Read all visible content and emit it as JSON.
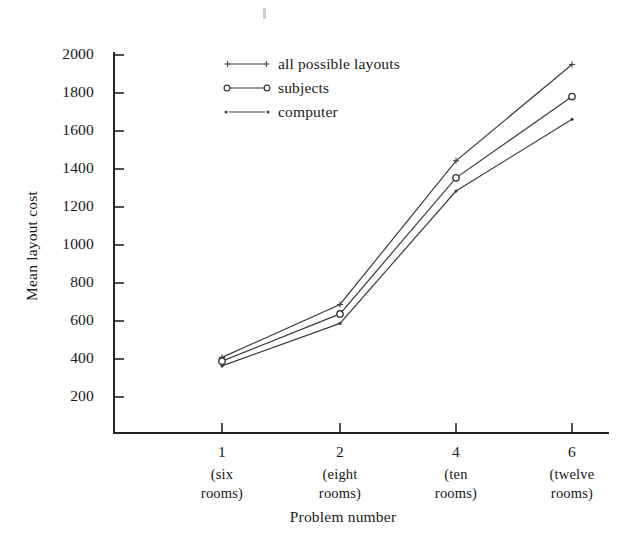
{
  "chart_data": {
    "type": "line",
    "title": "",
    "xlabel": "Problem number",
    "ylabel": "Mean layout cost",
    "categories": [
      "1",
      "2",
      "4",
      "6"
    ],
    "category_sublabels": [
      [
        "(six",
        "rooms)"
      ],
      [
        "(eight",
        "rooms)"
      ],
      [
        "(ten",
        "rooms)"
      ],
      [
        "(twelve",
        "rooms)"
      ]
    ],
    "x": [
      1,
      2,
      4,
      6
    ],
    "ylim": [
      0,
      2000
    ],
    "yticks": [
      200,
      400,
      600,
      800,
      1000,
      1200,
      1400,
      1600,
      1800,
      2000
    ],
    "ytick_labels": [
      "200",
      "400",
      "600",
      "800",
      "1000",
      "1200",
      "1400",
      "1600",
      "1800",
      "2000"
    ],
    "grid": false,
    "legend_position": "top-right",
    "series": [
      {
        "name": "all possible layouts",
        "marker": "plus",
        "values": [
          400,
          680,
          1440,
          1950
        ]
      },
      {
        "name": "subjects",
        "marker": "open-circle",
        "values": [
          380,
          630,
          1350,
          1780
        ]
      },
      {
        "name": "computer",
        "marker": "dot",
        "values": [
          355,
          580,
          1280,
          1660
        ]
      }
    ]
  },
  "legend": {
    "items": [
      {
        "label": "all possible layouts",
        "marker": "plus"
      },
      {
        "label": "subjects",
        "marker": "open-circle"
      },
      {
        "label": "computer",
        "marker": "dot"
      }
    ]
  },
  "axes": {
    "y_title": "Mean layout cost",
    "x_title": "Problem number",
    "y_labels": [
      "2000",
      "1800",
      "1600",
      "1400",
      "1200",
      "1000",
      "800",
      "600",
      "400",
      "200"
    ],
    "x_labels": [
      "1",
      "2",
      "4",
      "6"
    ],
    "x_sub_line1": [
      "(six",
      "(eight",
      "(ten",
      "(twelve"
    ],
    "x_sub_line2": [
      "rooms)",
      "rooms)",
      "rooms)",
      "rooms)"
    ]
  },
  "colors": {
    "line": "#3c3c41",
    "axis": "#232326",
    "text": "#17171a",
    "background": "#ffffff"
  }
}
